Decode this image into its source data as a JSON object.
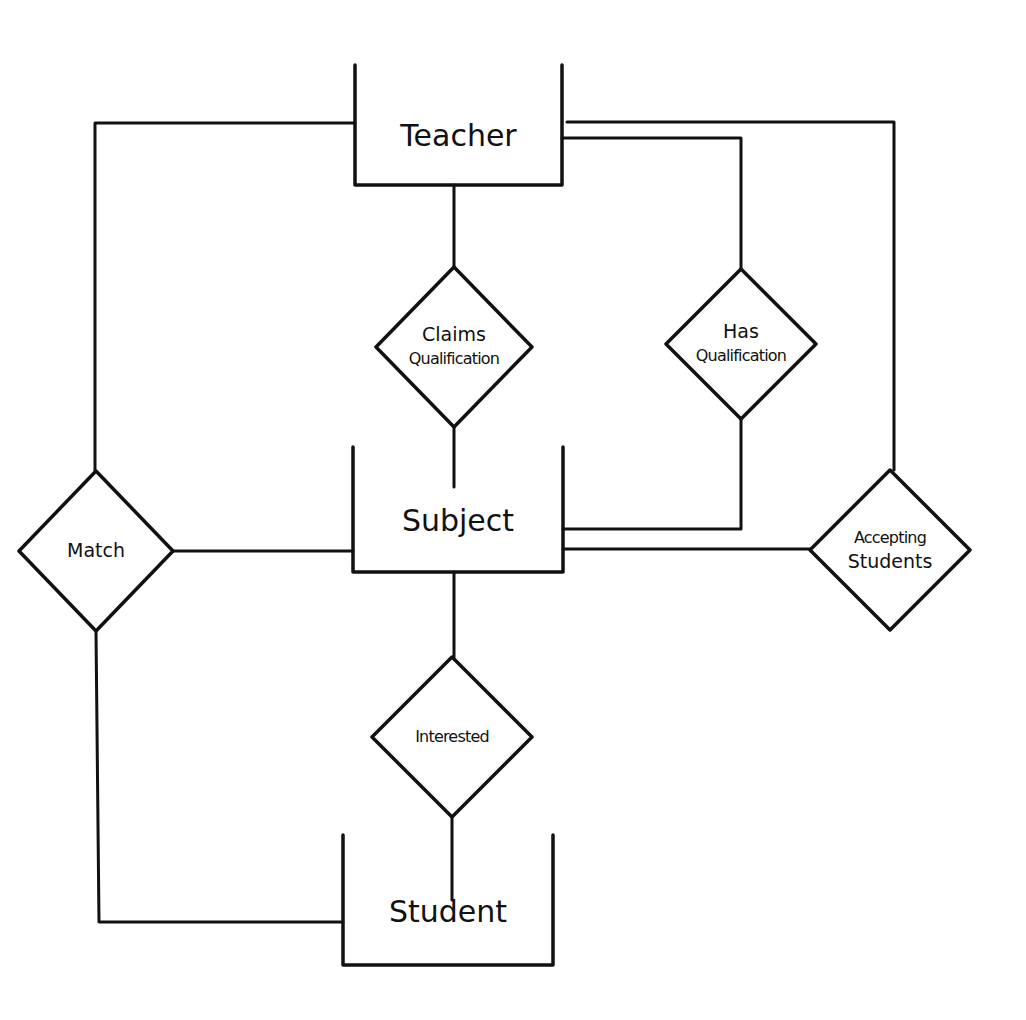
{
  "diagram": {
    "type": "entity-relationship",
    "style": "hand-drawn",
    "colors": {
      "stroke": "#111111",
      "background": "#ffffff"
    },
    "entities": [
      {
        "id": "teacher",
        "label": "Teacher",
        "x": 355,
        "y": 65,
        "w": 207,
        "h": 120
      },
      {
        "id": "subject",
        "label": "Subject",
        "x": 353,
        "y": 447,
        "w": 210,
        "h": 125
      },
      {
        "id": "student",
        "label": "Student",
        "x": 343,
        "y": 835,
        "w": 210,
        "h": 130
      }
    ],
    "relationships": [
      {
        "id": "claims_qualification",
        "lines": [
          "Claims",
          "Qualification"
        ],
        "cx": 454,
        "cy": 347,
        "rx": 78,
        "ry": 80
      },
      {
        "id": "has_qualification",
        "lines": [
          "Has",
          "Qualification"
        ],
        "cx": 741,
        "cy": 344,
        "rx": 75,
        "ry": 75
      },
      {
        "id": "match",
        "lines": [
          "Match"
        ],
        "cx": 96,
        "cy": 551,
        "rx": 77,
        "ry": 80
      },
      {
        "id": "accepting_students",
        "lines": [
          "Accepting",
          "Students"
        ],
        "cx": 890,
        "cy": 550,
        "rx": 80,
        "ry": 80
      },
      {
        "id": "interested",
        "lines": [
          "Interested"
        ],
        "cx": 452,
        "cy": 737,
        "rx": 80,
        "ry": 80
      }
    ],
    "connections": [
      {
        "from": "teacher",
        "to": "claims_qualification",
        "points": [
          [
            454,
            185
          ],
          [
            454,
            267
          ]
        ]
      },
      {
        "from": "claims_qualification",
        "to": "subject",
        "points": [
          [
            454,
            427
          ],
          [
            454,
            487
          ]
        ]
      },
      {
        "from": "teacher",
        "to": "has_qualification",
        "points": [
          [
            562,
            138
          ],
          [
            741,
            138
          ],
          [
            741,
            269
          ]
        ]
      },
      {
        "from": "has_qualification",
        "to": "subject",
        "points": [
          [
            741,
            419
          ],
          [
            741,
            529
          ],
          [
            563,
            529
          ]
        ]
      },
      {
        "from": "teacher",
        "to": "accepting_students",
        "points": [
          [
            567,
            122
          ],
          [
            894,
            122
          ],
          [
            894,
            470
          ]
        ]
      },
      {
        "from": "accepting_students",
        "to": "subject",
        "points": [
          [
            810,
            549
          ],
          [
            563,
            549
          ]
        ]
      },
      {
        "from": "teacher",
        "to": "match",
        "points": [
          [
            355,
            123
          ],
          [
            95,
            123
          ],
          [
            95,
            471
          ]
        ]
      },
      {
        "from": "match",
        "to": "subject",
        "points": [
          [
            173,
            551
          ],
          [
            353,
            551
          ]
        ]
      },
      {
        "from": "match",
        "to": "student",
        "points": [
          [
            96,
            631
          ],
          [
            99,
            922
          ],
          [
            343,
            922
          ]
        ]
      },
      {
        "from": "subject",
        "to": "interested",
        "points": [
          [
            454,
            572
          ],
          [
            454,
            657
          ]
        ]
      },
      {
        "from": "interested",
        "to": "student",
        "points": [
          [
            452,
            817
          ],
          [
            452,
            900
          ]
        ]
      }
    ]
  }
}
